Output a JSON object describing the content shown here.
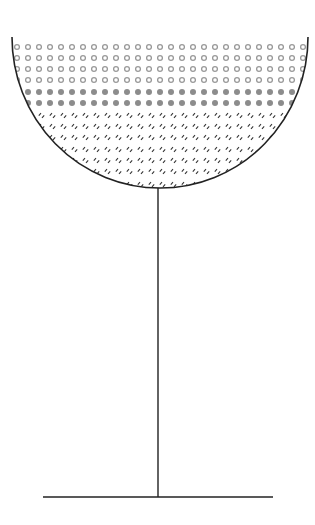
{
  "diagram": {
    "title": "",
    "colors": {
      "outline": "#222222",
      "hollow_dot": "#9a9a9a",
      "solid_dot": "#8c8c8c",
      "hatch": "#333333",
      "background": "#ffffff"
    },
    "bowl": {
      "left_x": 12,
      "right_x": 308,
      "rim_y": 37,
      "bottom_y": 188,
      "center_x": 158
    },
    "stem": {
      "x": 158,
      "top_y": 188,
      "bottom_y": 497
    },
    "base": {
      "x1": 43,
      "x2": 273,
      "y": 497
    },
    "grid": {
      "start_x": 17,
      "spacing_x": 11,
      "columns": 27
    },
    "layers": [
      {
        "name": "hollow-circles",
        "pattern": "open-circle",
        "rows": [
          47,
          58,
          69,
          80
        ]
      },
      {
        "name": "solid-circles",
        "pattern": "filled-circle",
        "rows": [
          92,
          103
        ]
      },
      {
        "name": "hatch-marks",
        "pattern": "double-slash",
        "rows": [
          116,
          127,
          138,
          150,
          161,
          172,
          185
        ]
      }
    ]
  }
}
